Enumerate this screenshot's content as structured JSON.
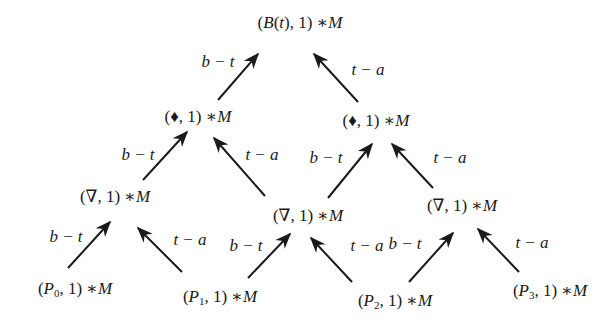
{
  "diagram": {
    "type": "recursive-evaluation-tree",
    "nodes": [
      {
        "id": "root",
        "text": "(B(t), 1) ∗ M",
        "x": 300,
        "y": 22
      },
      {
        "id": "l2a",
        "text": "(♦, 1) ∗ M",
        "x": 198,
        "y": 116
      },
      {
        "id": "l2b",
        "text": "(♦, 1) ∗ M",
        "x": 376,
        "y": 120
      },
      {
        "id": "l3a",
        "text": "(∇, 1) ∗ M",
        "x": 115,
        "y": 196
      },
      {
        "id": "l3b",
        "text": "(∇, 1) ∗ M",
        "x": 308,
        "y": 215
      },
      {
        "id": "l3c",
        "text": "(∇, 1) ∗ M",
        "x": 462,
        "y": 205
      },
      {
        "id": "p0",
        "text": "(P0, 1) ∗ M",
        "x": 75,
        "y": 288
      },
      {
        "id": "p1",
        "text": "(P1, 1) ∗ M",
        "x": 220,
        "y": 296
      },
      {
        "id": "p2",
        "text": "(P2, 1) ∗ M",
        "x": 395,
        "y": 300
      },
      {
        "id": "p3",
        "text": "(P3, 1) ∗ M",
        "x": 550,
        "y": 290
      }
    ],
    "edge_labels": {
      "left": "b − t",
      "right": "t − a"
    },
    "edges": [
      {
        "from": "l2a",
        "to": "root",
        "label": "b − t",
        "x1": 218,
        "y1": 100,
        "x2": 258,
        "y2": 54,
        "lx": 218,
        "ly": 62
      },
      {
        "from": "l2b",
        "to": "root",
        "label": "t − a",
        "x1": 358,
        "y1": 102,
        "x2": 314,
        "y2": 54,
        "lx": 368,
        "ly": 70
      },
      {
        "from": "l3a",
        "to": "l2a",
        "label": "b − t",
        "x1": 143,
        "y1": 180,
        "x2": 187,
        "y2": 132,
        "lx": 138,
        "ly": 155
      },
      {
        "from": "l3b",
        "to": "l2a",
        "label": "t − a",
        "x1": 265,
        "y1": 196,
        "x2": 214,
        "y2": 138,
        "lx": 262,
        "ly": 155
      },
      {
        "from": "l3b",
        "to": "l2b",
        "label": "b − t",
        "x1": 328,
        "y1": 198,
        "x2": 372,
        "y2": 144,
        "lx": 326,
        "ly": 158
      },
      {
        "from": "l3c",
        "to": "l2b",
        "label": "t − a",
        "x1": 433,
        "y1": 188,
        "x2": 392,
        "y2": 144,
        "lx": 450,
        "ly": 158
      },
      {
        "from": "p0",
        "to": "l3a",
        "label": "b − t",
        "x1": 68,
        "y1": 268,
        "x2": 110,
        "y2": 222,
        "lx": 66,
        "ly": 237
      },
      {
        "from": "p1",
        "to": "l3a",
        "label": "t − a",
        "x1": 182,
        "y1": 272,
        "x2": 138,
        "y2": 228,
        "lx": 190,
        "ly": 240
      },
      {
        "from": "p1",
        "to": "l3b",
        "label": "b − t",
        "x1": 248,
        "y1": 278,
        "x2": 290,
        "y2": 234,
        "lx": 246,
        "ly": 246
      },
      {
        "from": "p2",
        "to": "l3b",
        "label": "t − a",
        "x1": 352,
        "y1": 282,
        "x2": 311,
        "y2": 238,
        "lx": 367,
        "ly": 246
      },
      {
        "from": "p2",
        "to": "l3c",
        "label": "b − t",
        "x1": 409,
        "y1": 282,
        "x2": 453,
        "y2": 233,
        "lx": 405,
        "ly": 244
      },
      {
        "from": "p3",
        "to": "l3c",
        "label": "t − a",
        "x1": 519,
        "y1": 272,
        "x2": 478,
        "y2": 229,
        "lx": 532,
        "ly": 243
      }
    ]
  },
  "colors": {
    "ink": "#1a1a1a",
    "background": "#ffffff"
  }
}
